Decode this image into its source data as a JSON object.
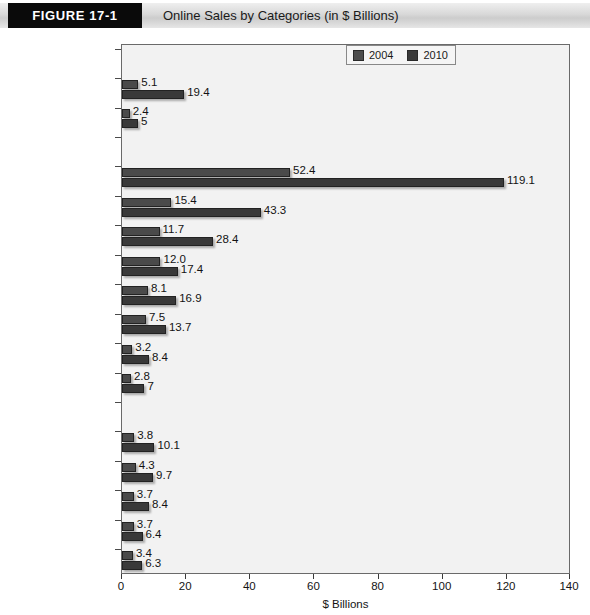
{
  "header": {
    "figure_tag": "FIGURE  17-1",
    "title": "Online Sales by Categories (in $ Billions)"
  },
  "legend": {
    "items": [
      {
        "label": "2004",
        "color": "#4a4a4a"
      },
      {
        "label": "2010",
        "color": "#393939"
      }
    ]
  },
  "axis": {
    "title": "$ Billions",
    "ticks": [
      "0",
      "20",
      "40",
      "60",
      "80",
      "100",
      "120",
      "140"
    ]
  },
  "rows": [
    {
      "label": "Replenishment",
      "type": "group"
    },
    {
      "label": "Food & beverage",
      "type": "data",
      "v2004": "5.1",
      "v2010": "19.4"
    },
    {
      "label": "Health/beauty",
      "type": "data",
      "v2004": "2.4",
      "v2010": "5"
    },
    {
      "label": "Researched",
      "type": "group"
    },
    {
      "label": "Travel",
      "type": "data",
      "v2004": "52.4",
      "v2010": "119.1"
    },
    {
      "label": "Home products",
      "type": "data",
      "v2004": "15.4",
      "v2010": "43.3"
    },
    {
      "label": "Apparel",
      "type": "data",
      "v2004": "11.7",
      "v2010": "28.4"
    },
    {
      "label": "Computer hard/software",
      "type": "data",
      "v2004": "12.0",
      "v2010": "17.4"
    },
    {
      "label": "Automotive/parts",
      "type": "data",
      "v2004": "8.1",
      "v2010": "16.9"
    },
    {
      "label": "Consumer electronics",
      "type": "data",
      "v2004": "7.5",
      "v2010": "13.7"
    },
    {
      "label": "Sporting goods",
      "type": "data",
      "v2004": "3.2",
      "v2010": "8.4"
    },
    {
      "label": "Jewelry/luxury goods",
      "type": "data",
      "v2004": "2.8",
      "v2010": "7"
    },
    {
      "label": "Convenience",
      "type": "group"
    },
    {
      "label": "Flowers, cards, gifts",
      "type": "data",
      "v2004": "3.8",
      "v2010": "10.1"
    },
    {
      "label": "Event tickets",
      "type": "data",
      "v2004": "4.3",
      "v2010": "9.7"
    },
    {
      "label": "Music/video",
      "type": "data",
      "v2004": "3.7",
      "v2010": "8.4"
    },
    {
      "label": "Books",
      "type": "data",
      "v2004": "3.7",
      "v2010": "6.4"
    },
    {
      "label": "Toys/video games",
      "type": "data",
      "v2004": "3.4",
      "v2010": "6.3"
    }
  ],
  "chart_data": {
    "type": "bar",
    "orientation": "horizontal",
    "title": "Online Sales by Categories (in $ Billions)",
    "xlabel": "$ Billions",
    "ylabel": "",
    "xlim": [
      0,
      140
    ],
    "xticks": [
      0,
      20,
      40,
      60,
      80,
      100,
      120,
      140
    ],
    "grid": false,
    "legend_position": "top-right",
    "groups": [
      {
        "name": "Replenishment",
        "categories": [
          "Food & beverage",
          "Health/beauty"
        ]
      },
      {
        "name": "Researched",
        "categories": [
          "Travel",
          "Home products",
          "Apparel",
          "Computer hard/software",
          "Automotive/parts",
          "Consumer electronics",
          "Sporting goods",
          "Jewelry/luxury goods"
        ]
      },
      {
        "name": "Convenience",
        "categories": [
          "Flowers, cards, gifts",
          "Event tickets",
          "Music/video",
          "Books",
          "Toys/video games"
        ]
      }
    ],
    "categories": [
      "Food & beverage",
      "Health/beauty",
      "Travel",
      "Home products",
      "Apparel",
      "Computer hard/software",
      "Automotive/parts",
      "Consumer electronics",
      "Sporting goods",
      "Jewelry/luxury goods",
      "Flowers, cards, gifts",
      "Event tickets",
      "Music/video",
      "Books",
      "Toys/video games"
    ],
    "series": [
      {
        "name": "2004",
        "color": "#4a4a4a",
        "values": [
          5.1,
          2.4,
          52.4,
          15.4,
          11.7,
          12.0,
          8.1,
          7.5,
          3.2,
          2.8,
          3.8,
          4.3,
          3.7,
          3.7,
          3.4
        ]
      },
      {
        "name": "2010",
        "color": "#393939",
        "values": [
          19.4,
          5,
          119.1,
          43.3,
          28.4,
          17.4,
          16.9,
          13.7,
          8.4,
          7,
          10.1,
          9.7,
          8.4,
          6.4,
          6.3
        ]
      }
    ]
  }
}
